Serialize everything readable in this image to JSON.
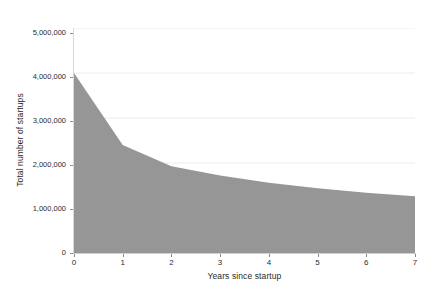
{
  "chart_data": {
    "type": "area",
    "title": "",
    "subtitle": "",
    "xlabel": "Years since startup",
    "ylabel": "Total number of startups",
    "x": [
      0,
      1,
      2,
      3,
      4,
      5,
      6,
      7
    ],
    "categories": [
      "0",
      "1",
      "2",
      "3",
      "4",
      "5",
      "6",
      "7"
    ],
    "values": [
      4000000,
      2400000,
      1930000,
      1720000,
      1560000,
      1440000,
      1340000,
      1260000
    ],
    "series": [
      {
        "name": "Total number of startups",
        "values": [
          4000000,
          2400000,
          1930000,
          1720000,
          1560000,
          1440000,
          1340000,
          1260000
        ]
      }
    ],
    "xlim": [
      0,
      7
    ],
    "ylim": [
      0,
      5000000
    ],
    "x_ticks": [
      0,
      1,
      2,
      3,
      4,
      5,
      6,
      7
    ],
    "x_tick_labels": [
      "0",
      "1",
      "2",
      "3",
      "4",
      "5",
      "6",
      "7"
    ],
    "y_ticks": [
      0,
      1000000,
      2000000,
      3000000,
      4000000,
      5000000
    ],
    "y_tick_labels": [
      "0",
      "1,000,000",
      "2,000,000",
      "3,000,000",
      "4,000,000",
      "5,000,000"
    ],
    "grid": true,
    "grid_axis": "y",
    "legend": false,
    "legend_position": "none",
    "area_color": "#969696",
    "grid_color": "#ececec",
    "axis_color": "#cfcfcf",
    "text_color": "#2b2b2b",
    "background_color": "#ffffff"
  }
}
